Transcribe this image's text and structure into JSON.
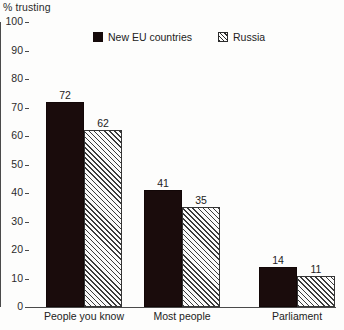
{
  "chart_data": {
    "type": "bar",
    "title": "",
    "ylabel": "% trusting",
    "xlabel": "",
    "ylim": [
      0,
      100
    ],
    "yticks": [
      0,
      10,
      20,
      30,
      40,
      50,
      60,
      70,
      80,
      90,
      100
    ],
    "grid": false,
    "legend_position": "top-center",
    "categories": [
      "People you know",
      "Most people",
      "Parliament"
    ],
    "series": [
      {
        "name": "New EU countries",
        "fill": "solid",
        "color": "#1a0c0c",
        "values": [
          72,
          41,
          14
        ]
      },
      {
        "name": "Russia",
        "fill": "diagonal-hatch",
        "color": "#3a3a3a",
        "values": [
          62,
          35,
          11
        ]
      }
    ]
  }
}
